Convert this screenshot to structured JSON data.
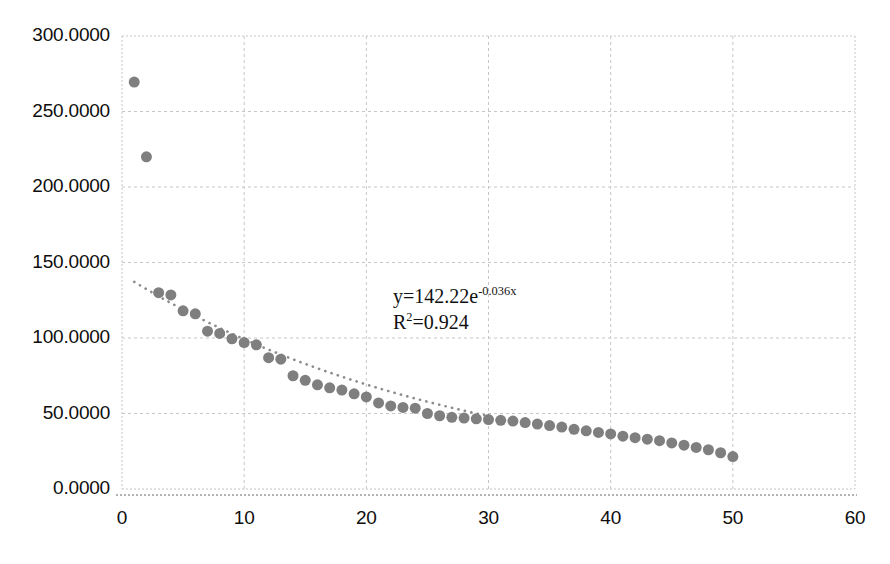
{
  "chart_data": {
    "type": "scatter",
    "title": "",
    "subtitle": "",
    "xlabel": "",
    "ylabel": "",
    "xlim": [
      0,
      60
    ],
    "ylim": [
      0,
      300
    ],
    "x_ticks": [
      0,
      10,
      20,
      30,
      40,
      50,
      60
    ],
    "x_tick_labels": [
      "0",
      "10",
      "20",
      "30",
      "40",
      "50",
      "60"
    ],
    "y_ticks": [
      0,
      50,
      100,
      150,
      200,
      250,
      300
    ],
    "y_tick_labels": [
      "0.0000",
      "50.0000",
      "100.0000",
      "150.0000",
      "200.0000",
      "250.0000",
      "300.0000"
    ],
    "grid": true,
    "grid_style": "dotted",
    "legend": "none",
    "marker": {
      "shape": "circle",
      "color": "#7f7f7f",
      "size": 11
    },
    "series": [
      {
        "name": "data",
        "x": [
          1,
          2,
          3,
          4,
          5,
          6,
          7,
          8,
          9,
          10,
          11,
          12,
          13,
          14,
          15,
          16,
          17,
          18,
          19,
          20,
          21,
          22,
          23,
          24,
          25,
          26,
          27,
          28,
          29,
          30,
          31,
          32,
          33,
          34,
          35,
          36,
          37,
          38,
          39,
          40,
          41,
          42,
          43,
          44,
          45,
          46,
          47,
          48,
          49,
          50
        ],
        "y": [
          269.5,
          220.0,
          130.0,
          128.5,
          118.0,
          116.0,
          104.5,
          103.0,
          99.5,
          97.0,
          95.5,
          87.0,
          86.0,
          75.0,
          72.0,
          69.0,
          67.0,
          65.5,
          63.0,
          61.0,
          57.0,
          55.0,
          54.0,
          53.5,
          50.0,
          48.5,
          47.5,
          47.0,
          46.5,
          46.0,
          45.5,
          45.0,
          44.0,
          43.0,
          42.0,
          41.0,
          39.5,
          38.5,
          37.5,
          36.5,
          35.0,
          34.0,
          33.0,
          32.0,
          30.5,
          29.0,
          27.5,
          26.0,
          24.0,
          21.5
        ]
      }
    ],
    "trendline": {
      "type": "exponential",
      "a": 142.22,
      "b": -0.036,
      "equation": "y=142.22e",
      "equation_exponent": "-0.036x",
      "r_squared_label": "R",
      "r_squared_exponent": "2",
      "r_squared_value": "=0.924",
      "color": "#8c8c8c",
      "style": "dotted",
      "x_start": 1,
      "x_end": 30
    },
    "annotations": [
      {
        "text": "y=142.22e",
        "exponent": "-0.036x"
      },
      {
        "text": "R",
        "exponent": "2",
        "tail": "=0.924"
      }
    ]
  },
  "colors": {
    "marker": "#7f7f7f",
    "grid": "#c6c6c6",
    "axis": "#bfbfbf",
    "text": "#0d0d0d",
    "background": "#ffffff"
  }
}
